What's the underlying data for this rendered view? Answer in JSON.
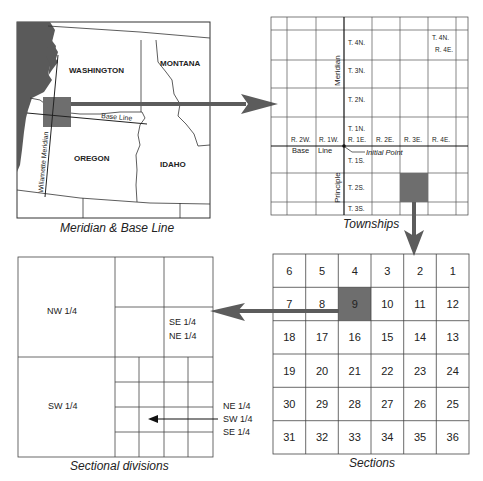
{
  "colors": {
    "line": "#333333",
    "shade": "#6e6e6e",
    "water": "#5a5a5a",
    "arrow": "#5c5c5c",
    "background": "#ffffff"
  },
  "map_panel": {
    "caption": "Meridian & Base Line",
    "states": [
      "WASHINGTON",
      "MONTANA",
      "OREGON",
      "IDAHO"
    ],
    "base_line_label": "Base Line",
    "meridian_label": "Willamette Meridian"
  },
  "townships_panel": {
    "caption": "Townships",
    "meridian_label": "Meridian",
    "principle_label": "Principle",
    "base_line_label_1": "Base",
    "base_line_label_2": "Line",
    "initial_point_label": "Initial Point",
    "townships_north": [
      "T. 4N.",
      "T. 3N.",
      "T. 2N.",
      "T. 1N."
    ],
    "townships_south": [
      "T. 1S.",
      "T. 2S.",
      "T. 3S."
    ],
    "ranges": [
      "R. 2W.",
      "R. 1W.",
      "R. 1E.",
      "R. 2E.",
      "R. 3E.",
      "R. 4E."
    ],
    "corner_label_1": "T. 4N.",
    "corner_label_2": "R. 4E."
  },
  "sections_panel": {
    "caption": "Sections",
    "highlighted_section": "9",
    "rows": [
      [
        "6",
        "5",
        "4",
        "3",
        "2",
        "1"
      ],
      [
        "7",
        "8",
        "9",
        "10",
        "11",
        "12"
      ],
      [
        "18",
        "17",
        "16",
        "15",
        "14",
        "13"
      ],
      [
        "19",
        "20",
        "21",
        "22",
        "23",
        "24"
      ],
      [
        "30",
        "29",
        "28",
        "27",
        "26",
        "25"
      ],
      [
        "31",
        "32",
        "33",
        "34",
        "35",
        "36"
      ]
    ]
  },
  "divisions_panel": {
    "caption": "Sectional divisions",
    "nw": "NW 1/4",
    "sw": "SW 1/4",
    "se_ne_1": "SE 1/4",
    "se_ne_2": "NE 1/4",
    "ne_sw_se_1": "NE 1/4",
    "ne_sw_se_2": "SW 1/4",
    "ne_sw_se_3": "SE 1/4"
  }
}
